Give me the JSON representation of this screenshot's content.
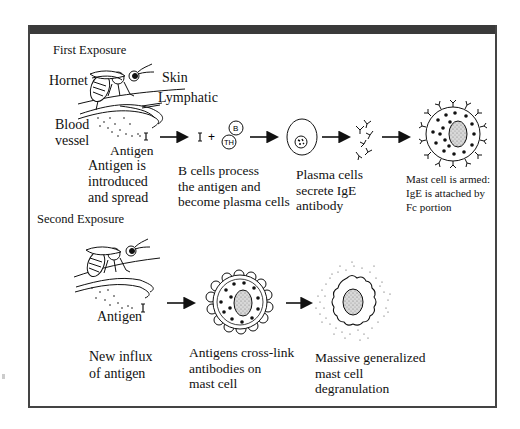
{
  "diagram": {
    "frame": {
      "topbar_color": "#3a3a3a",
      "border_color": "#444444",
      "background": "#ffffff"
    },
    "first_exposure": {
      "heading": "First Exposure",
      "labels": {
        "hornet": "Hornet",
        "skin": "Skin",
        "lymphatic": "Lymphatic",
        "blood": "Blood",
        "vessel": "vessel",
        "antigen": "Antigen"
      },
      "steps": [
        {
          "lines": [
            "Antigen is",
            "introduced",
            "and spread"
          ]
        },
        {
          "lines": [
            "B cells process",
            "the antigen and",
            "become plasma cells"
          ],
          "cell_labels": [
            "B",
            "TH"
          ]
        },
        {
          "lines": [
            "Plasma cells",
            "secrete IgE",
            "antibody"
          ]
        },
        {
          "lines": [
            "Mast cell is armed:",
            "IgE is attached by",
            "Fc portion"
          ]
        }
      ]
    },
    "second_exposure": {
      "heading": "Second Exposure",
      "labels": {
        "antigen": "Antigen"
      },
      "steps": [
        {
          "lines": [
            "New influx",
            "of antigen"
          ]
        },
        {
          "lines": [
            "Antigens cross-link",
            "antibodies on",
            "mast cell"
          ]
        },
        {
          "lines": [
            "Massive generalized",
            "mast cell",
            "degranulation"
          ]
        }
      ]
    }
  }
}
